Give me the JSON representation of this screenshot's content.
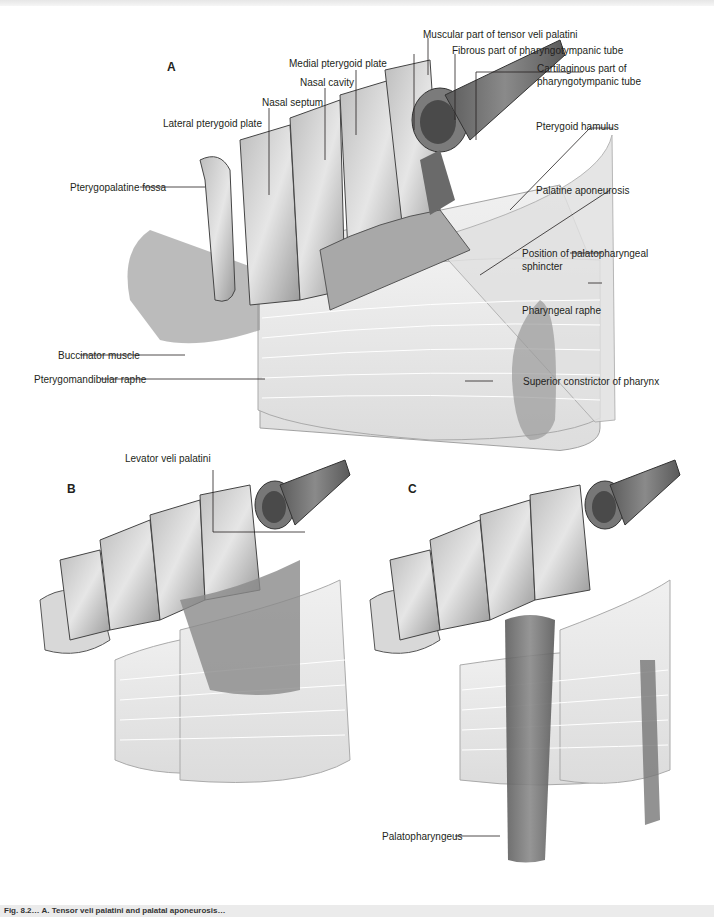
{
  "figure": {
    "panels": [
      {
        "letter": "A"
      },
      {
        "letter": "B"
      },
      {
        "letter": "C"
      }
    ],
    "panel_a_labels": {
      "muscular_tensor": "Muscular part of tensor veli palatini",
      "fibrous_tube": "Fibrous part of pharyngotympanic tube",
      "cartilaginous_tube_1": "Cartilaginous part of",
      "cartilaginous_tube_2": "pharyngotympanic tube",
      "medial_plate": "Medial pterygoid plate",
      "nasal_cavity": "Nasal cavity",
      "nasal_septum": "Nasal septum",
      "lateral_plate": "Lateral pterygoid plate",
      "pterygoid_hamulus": "Pterygoid hamulus",
      "pterygopalatine_fossa": "Pterygopalatine fossa",
      "palatine_aponeurosis": "Palatine aponeurosis",
      "palatopharyngeal_sphincter_1": "Position of palatopharyngeal",
      "palatopharyngeal_sphincter_2": "sphincter",
      "pharyngeal_raphe": "Pharyngeal raphe",
      "buccinator": "Buccinator muscle",
      "pterygomandibular_raphe": "Pterygomandibular raphe",
      "superior_constrictor": "Superior constrictor of pharynx"
    },
    "panel_b_labels": {
      "levator": "Levator veli palatini"
    },
    "panel_c_labels": {
      "palatopharyngeus": "Palatopharyngeus"
    },
    "caption": "Fig. 8.2… A. Tensor veli palatini and palatal aponeurosis…"
  },
  "colors": {
    "bone": "#d9d9d9",
    "bone_dark": "#8c8c8c",
    "muscle": "#6e6e6e",
    "constrictor": "#e8e8e8",
    "leader": "#231f20"
  }
}
